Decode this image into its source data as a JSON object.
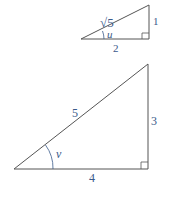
{
  "small_triangle": {
    "hypotenuse_label": "√5",
    "vertical_leg_label": "1",
    "horizontal_leg_label": "2",
    "angle_label": "u",
    "right_angle_marker": true
  },
  "large_triangle": {
    "hypotenuse_label": "5",
    "vertical_leg_label": "3",
    "horizontal_leg_label": "4",
    "angle_label": "v",
    "right_angle_marker": true
  },
  "colors": {
    "lines": "#444444",
    "labels": "#3a5a8a",
    "background": "#ffffff"
  }
}
